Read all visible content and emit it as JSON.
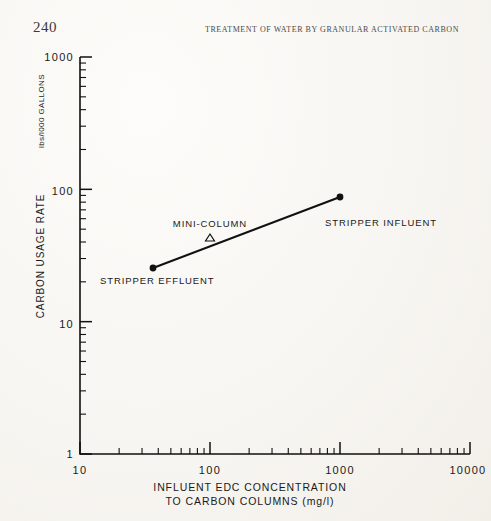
{
  "page": {
    "number": "240",
    "running_head": "TREATMENT OF WATER BY GRANULAR ACTIVATED CARBON",
    "background_color": "#fbfaf7",
    "ink_color": "#111111"
  },
  "chart_data": {
    "type": "line",
    "title": "",
    "xlabel_line1": "INFLUENT EDC CONCENTRATION",
    "xlabel_line2": "TO CARBON COLUMNS (mg/l)",
    "ylabel_main": "CARBON USAGE RATE",
    "ylabel_units": "lbs/l000 GALLONS",
    "xscale": "log",
    "yscale": "log",
    "xlim": [
      10,
      10000
    ],
    "ylim": [
      1,
      1000
    ],
    "xticks": [
      "10",
      "100",
      "1000",
      "10000"
    ],
    "yticks": [
      "1",
      "10",
      "100",
      "1000"
    ],
    "grid": false,
    "legend": "none",
    "series": [
      {
        "name": "carbon usage rate correlation",
        "marker": "filled-circle",
        "x": [
          55,
          1200
        ],
        "y": [
          26,
          80
        ],
        "point_labels": [
          "STRIPPER EFFLUENT",
          "STRIPPER INFLUENT"
        ]
      },
      {
        "name": "mini-column",
        "marker": "open-triangle",
        "x": [
          130
        ],
        "y": [
          45
        ],
        "point_labels": [
          "MINI-COLUMN"
        ]
      }
    ],
    "annotations": [
      {
        "text": "MINI-COLUMN",
        "x": 130,
        "y": 60
      },
      {
        "text": "STRIPPER EFFLUENT",
        "x": 60,
        "y": 19
      },
      {
        "text": "STRIPPER INFLUENT",
        "x": 1350,
        "y": 62
      }
    ]
  }
}
